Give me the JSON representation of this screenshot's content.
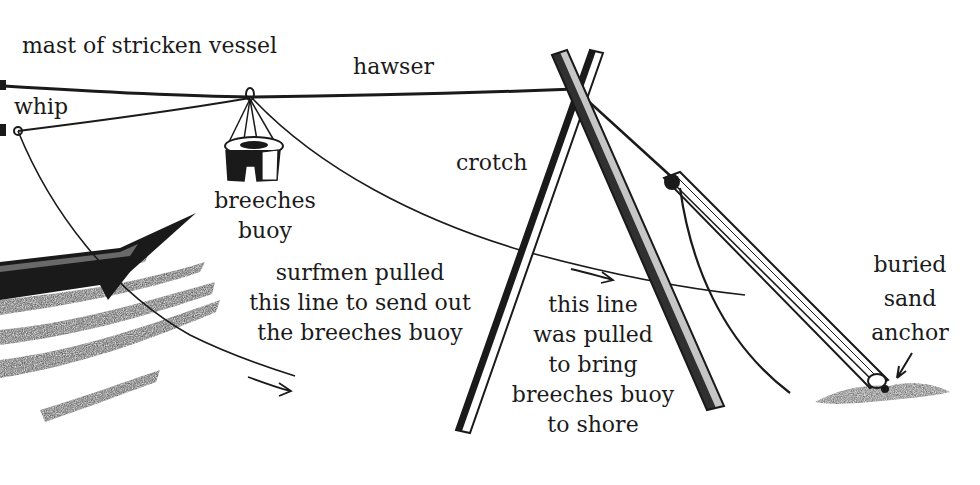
{
  "diagram": {
    "type": "illustration",
    "colors": {
      "ink": "#1a1a1a",
      "background": "#ffffff"
    },
    "labels": {
      "mast": "mast of stricken vessel",
      "hawser": "hawser",
      "whip": "whip",
      "crotch": "crotch",
      "breeches_buoy": [
        "breeches",
        "buoy"
      ],
      "send_out_line": [
        "surfmen pulled",
        "this line to send out",
        "the breeches buoy"
      ],
      "return_line": [
        "this line",
        "was pulled",
        "to bring",
        "breeches buoy",
        "to shore"
      ],
      "sand_anchor": [
        "buried",
        "sand",
        "anchor"
      ]
    },
    "elements": [
      {
        "id": "hawser",
        "desc": "main rope from mast to crotch and anchor"
      },
      {
        "id": "whip",
        "desc": "endless pulley line moving the buoy"
      },
      {
        "id": "breeches-buoy",
        "desc": "life ring with canvas breeches hung from hawser"
      },
      {
        "id": "crotch",
        "desc": "X-shaped wooden support holding hawser up"
      },
      {
        "id": "sand-anchor",
        "desc": "buried anchor securing hawser via tackle"
      },
      {
        "id": "ship-bow",
        "desc": "stricken vessel in surf at left edge"
      }
    ]
  }
}
